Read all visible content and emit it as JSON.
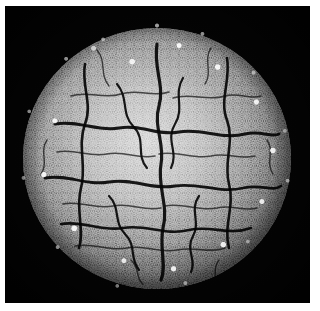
{
  "figure": {
    "kind": "micrograph",
    "title": "Grayscale micrograph of a spherical granular specimen",
    "alt_text": "Electron micrograph showing a roughly spherical, densely granular body with dark branching furrows across its surface, isolated on a black background",
    "background_color": "#040404",
    "page_color": "#ffffff",
    "plate": {
      "label": "micrograph plate",
      "x": 5,
      "y": 6,
      "width": 305,
      "height": 297
    },
    "specimen": {
      "label": "spherical specimen",
      "shape": "sphere",
      "center_x": 152,
      "center_y": 152,
      "diameter": 268,
      "surface_texture": "granular with branching furrows",
      "core_tone": "#cfcfcf",
      "mid_tone": "#8e8e8e",
      "rim_tone": "#4a4a4a",
      "furrow_color": "#0a0a0a",
      "granule_highlight_color": "#ffffff"
    },
    "regions": [
      {
        "name": "bright-core",
        "description": "smoother, brighter central area"
      },
      {
        "name": "furrow-network",
        "description": "dark branching crack-like grooves"
      },
      {
        "name": "granular-rim",
        "description": "knobby bright granules along the perimeter"
      },
      {
        "name": "black-field",
        "description": "uniform black background field"
      }
    ]
  },
  "colors": {
    "background": "#040404",
    "page": "#ffffff",
    "highlight": "#ffffff",
    "shadow": "#0a0a0a"
  }
}
